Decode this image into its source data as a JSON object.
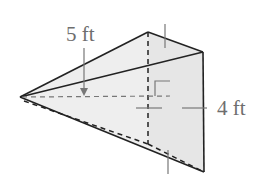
{
  "figure": {
    "type": "pyramid",
    "colors": {
      "fill": "#eeeeee",
      "edge": "#222222",
      "dim": "#777777",
      "label": "#6e6e6e"
    },
    "vertices": {
      "apex": [
        20,
        97
      ],
      "base_top": [
        148,
        32
      ],
      "base_right_top": [
        203,
        52
      ],
      "base_bottom": [
        204,
        172
      ],
      "foot": [
        148,
        144
      ]
    }
  },
  "labels": {
    "slant_height": "5 ft",
    "base_side": "4 ft"
  },
  "annotations": {
    "right_angle_marker": true,
    "arrow_target": "slant height dashed line"
  }
}
